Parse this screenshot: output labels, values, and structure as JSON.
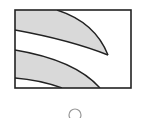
{
  "figure": {
    "colors": {
      "stroke": "#222222",
      "fill": "#d9d9d9",
      "background": "#ffffff",
      "option_stroke": "#999999"
    },
    "option": {
      "selected": false
    }
  }
}
